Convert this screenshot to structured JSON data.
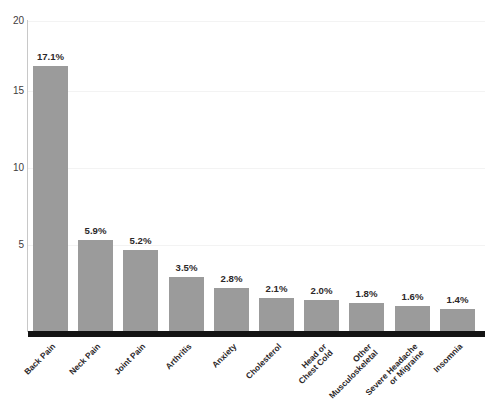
{
  "chart_data": {
    "type": "bar",
    "title": "",
    "subtitle": "",
    "xlabel": "",
    "ylabel": "",
    "ylim": [
      0,
      20
    ],
    "yticks": [
      20,
      15,
      10,
      5
    ],
    "grid": true,
    "legend": null,
    "bar_color": "#9b9b9b",
    "axis_color": "#141414",
    "categories": [
      "Back Pain",
      "Neck Pain",
      "Joint Pain",
      "Arthritis",
      "Anxiety",
      "Cholesterol",
      "Head or Chest Cold",
      "Other Musculoskeletal",
      "Severe Headache or Migraine",
      "Insomnia"
    ],
    "category_lines": [
      [
        "Back Pain",
        ""
      ],
      [
        "Neck Pain",
        ""
      ],
      [
        "Joint Pain",
        ""
      ],
      [
        "Arthritis",
        ""
      ],
      [
        "Anxiety",
        ""
      ],
      [
        "Cholesterol",
        ""
      ],
      [
        "Head or",
        "Chest Cold"
      ],
      [
        "Other",
        "Musculoskeletal"
      ],
      [
        "Severe Headache",
        "or Migraine"
      ],
      [
        "Insomnia",
        ""
      ]
    ],
    "values": [
      17.1,
      5.9,
      5.2,
      3.5,
      2.8,
      2.1,
      2.0,
      1.8,
      1.6,
      1.4
    ],
    "data_labels": [
      "17.1%",
      "5.9%",
      "5.2%",
      "3.5%",
      "2.8%",
      "2.1%",
      "2.0%",
      "1.8%",
      "1.6%",
      "1.4%"
    ]
  }
}
